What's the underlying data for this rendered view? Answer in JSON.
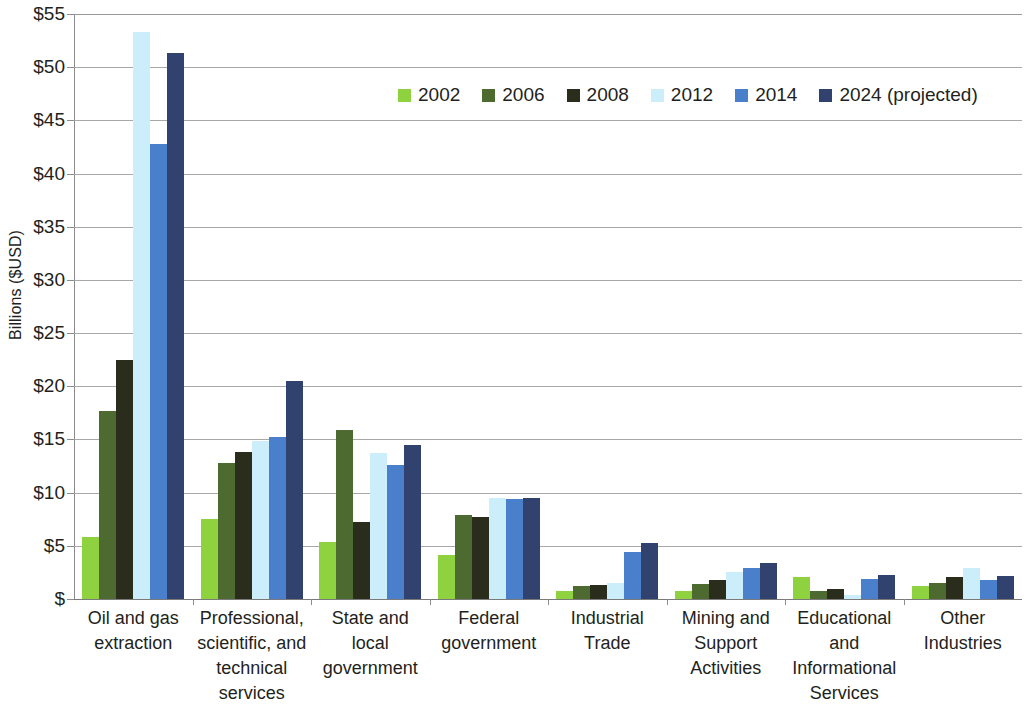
{
  "chart_data": {
    "type": "bar",
    "title": "",
    "xlabel": "",
    "ylabel": "Billions ($USD)",
    "ylim": [
      0,
      55
    ],
    "ytick_values": [
      0,
      5,
      10,
      15,
      20,
      25,
      30,
      35,
      40,
      45,
      50,
      55
    ],
    "ytick_labels": [
      "$",
      "$5",
      "$10",
      "$15",
      "$20",
      "$25",
      "$30",
      "$35",
      "$40",
      "$45",
      "$50",
      "$55"
    ],
    "grid": true,
    "legend_position": "top-center",
    "categories": [
      "Oil and gas extraction",
      "Professional, scientific, and technical services",
      "State and local government",
      "Federal government",
      "Industrial Trade",
      "Mining and Support Activities",
      "Educational and Informational Services",
      "Other Industries"
    ],
    "category_lines": [
      [
        "Oil and gas",
        "extraction"
      ],
      [
        "Professional,",
        "scientific, and",
        "technical",
        "services"
      ],
      [
        "State and",
        "local",
        "government"
      ],
      [
        "Federal",
        "government"
      ],
      [
        "Industrial",
        "Trade"
      ],
      [
        "Mining and",
        "Support",
        "Activities"
      ],
      [
        "Educational",
        "and",
        "Informational",
        "Services"
      ],
      [
        "Other",
        "Industries"
      ]
    ],
    "series": [
      {
        "name": "2002",
        "color": "#8FD240",
        "values": [
          5.8,
          7.5,
          5.4,
          4.1,
          0.8,
          0.8,
          2.1,
          1.2
        ]
      },
      {
        "name": "2006",
        "color": "#4D6B30",
        "values": [
          17.7,
          12.8,
          15.9,
          7.9,
          1.2,
          1.4,
          0.8,
          1.5
        ]
      },
      {
        "name": "2008",
        "color": "#2B2D1C",
        "values": [
          22.5,
          13.8,
          7.2,
          7.7,
          1.3,
          1.8,
          0.9,
          2.1
        ]
      },
      {
        "name": "2012",
        "color": "#CBEEFA",
        "values": [
          53.3,
          14.9,
          13.7,
          9.5,
          1.5,
          2.5,
          0.4,
          2.9
        ]
      },
      {
        "name": "2014",
        "color": "#4A7FCB",
        "values": [
          42.8,
          15.2,
          12.6,
          9.4,
          4.4,
          2.9,
          1.9,
          1.8
        ]
      },
      {
        "name": "2024 (projected)",
        "color": "#31426E",
        "values": [
          51.3,
          20.5,
          14.5,
          9.5,
          5.3,
          3.4,
          2.3,
          2.2
        ]
      }
    ]
  }
}
